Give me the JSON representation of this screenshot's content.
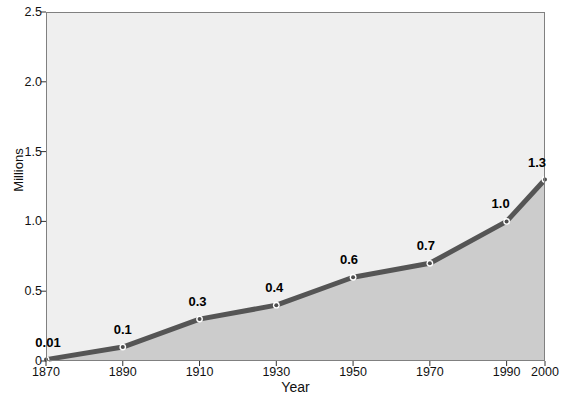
{
  "chart_data": {
    "type": "area",
    "title": "",
    "subtitle": "",
    "xlabel": "Year",
    "ylabel": "Millions",
    "categories": [
      "1870",
      "1890",
      "1910",
      "1930",
      "1950",
      "1970",
      "1990",
      "2000"
    ],
    "x": [
      1870,
      1890,
      1910,
      1930,
      1950,
      1970,
      1990,
      2000
    ],
    "values": [
      0.01,
      0.1,
      0.3,
      0.4,
      0.6,
      0.7,
      1.0,
      1.3
    ],
    "point_labels": [
      "0.01",
      "0.1",
      "0.3",
      "0.4",
      "0.6",
      "0.7",
      "1.0",
      "1.3"
    ],
    "ylim": [
      0,
      2.5
    ],
    "yticks": [
      0,
      0.5,
      1.0,
      1.5,
      2.0,
      2.5
    ],
    "ytick_labels": [
      "0",
      "0.5",
      "1.0",
      "1.5",
      "2.0",
      "2.5"
    ],
    "xtick_labels": [
      "1870",
      "1890",
      "1910",
      "1930",
      "1950",
      "1970",
      "1990",
      "2000"
    ],
    "grid": false,
    "legend": "none",
    "markers": true,
    "colors": {
      "line": "#555555",
      "marker_fill": "#4d4d4d",
      "marker_edge": "#ffffff",
      "area_fill": "#cccccc",
      "plot_background": "#efefef",
      "frame": "#808080",
      "text": "#111111",
      "page_background": "#ffffff"
    }
  },
  "axes": {
    "y_title": "Millions",
    "x_title": "Year"
  }
}
